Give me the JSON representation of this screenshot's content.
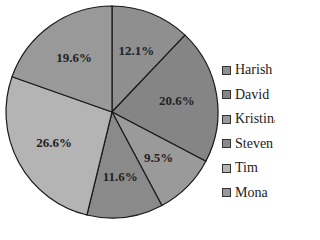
{
  "chart_data": {
    "type": "pie",
    "title": "",
    "categories": [
      "Harish",
      "David",
      "Kristina",
      "Steven",
      "Tim",
      "Mona"
    ],
    "values": [
      12.1,
      20.6,
      9.5,
      11.6,
      26.6,
      19.6
    ],
    "labels": [
      "12.1%",
      "20.6%",
      "9.5%",
      "11.6%",
      "26.6%",
      "19.6%"
    ],
    "colors": [
      "#8f8f8f",
      "#858585",
      "#9a9a9a",
      "#8a8a8a",
      "#b4b4b4",
      "#999999"
    ],
    "start_angle_deg": 90,
    "direction": "clockwise",
    "legend_position": "right"
  },
  "legend": {
    "items": [
      {
        "label": "Harish",
        "color": "#8f8f8f"
      },
      {
        "label": "David",
        "color": "#858585"
      },
      {
        "label": "Kristina",
        "color": "#9a9a9a"
      },
      {
        "label": "Steven",
        "color": "#8a8a8a"
      },
      {
        "label": "Tim",
        "color": "#b4b4b4"
      },
      {
        "label": "Mona",
        "color": "#999999"
      }
    ]
  }
}
